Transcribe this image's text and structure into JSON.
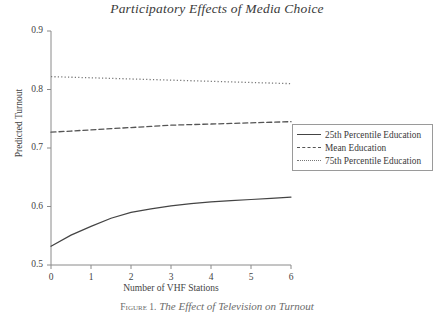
{
  "figure": {
    "title": "Participatory Effects of Media Choice",
    "caption_prefix": "Figure 1.",
    "caption_text": "The Effect of Television on Turnout"
  },
  "chart_data": {
    "type": "line",
    "title": "Participatory Effects of Media Choice",
    "xlabel": "Number of VHF Stations",
    "ylabel": "Predicted Turnout",
    "xlim": [
      0,
      6
    ],
    "ylim": [
      0.5,
      0.9
    ],
    "xticks": [
      "0",
      "1",
      "2",
      "3",
      "4",
      "5",
      "6"
    ],
    "yticks": [
      "0.5",
      "0.6",
      "0.7",
      "0.8",
      "0.9"
    ],
    "grid": false,
    "legend_position": "right-middle",
    "x": [
      0,
      0.5,
      1,
      1.5,
      2,
      2.5,
      3,
      3.5,
      4,
      4.5,
      5,
      5.5,
      6
    ],
    "series": [
      {
        "name": "25th Percentile Education",
        "style": "solid",
        "color": "#444444",
        "values": [
          0.532,
          0.551,
          0.566,
          0.58,
          0.59,
          0.596,
          0.601,
          0.605,
          0.608,
          0.61,
          0.612,
          0.614,
          0.616
        ]
      },
      {
        "name": "Mean Education",
        "style": "dashed",
        "color": "#555555",
        "values": [
          0.727,
          0.729,
          0.731,
          0.733,
          0.735,
          0.737,
          0.739,
          0.74,
          0.741,
          0.742,
          0.743,
          0.744,
          0.745
        ]
      },
      {
        "name": "75th Percentile Education",
        "style": "dotted",
        "color": "#777777",
        "values": [
          0.822,
          0.821,
          0.82,
          0.819,
          0.818,
          0.817,
          0.816,
          0.815,
          0.814,
          0.813,
          0.812,
          0.811,
          0.81
        ]
      }
    ]
  },
  "legend": {
    "items": [
      {
        "label": "25th Percentile Education"
      },
      {
        "label": "Mean Education"
      },
      {
        "label": "75th Percentile Education"
      }
    ]
  }
}
